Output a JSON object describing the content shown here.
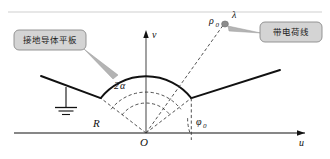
{
  "figure": {
    "callouts": [
      {
        "id": "left-callout",
        "text": "接地导体平板"
      },
      {
        "id": "right-callout",
        "text": "带电荷线"
      }
    ],
    "axes": {
      "horizontal_label": "u",
      "vertical_label": "v",
      "origin_label": "O"
    },
    "labels": {
      "radius": "R",
      "half_angle": "2",
      "half_angle_symbol": "α",
      "phi": "φ",
      "phi_sub": "0",
      "rho": "ρ",
      "rho_sub": "0",
      "lambda": "λ"
    },
    "colors": {
      "stroke": "#111111",
      "dashed": "#3a3a3a",
      "callout_fill": "#d4d4d4",
      "callout_border": "#8a8a8a",
      "callout_text": "#1a1a1a",
      "leader": "#a8a8a8",
      "background": "#ffffff"
    },
    "geometry": {
      "origin_x": 146,
      "origin_y": 133,
      "circle_radius": 58,
      "inner_arc_radius_1": 30,
      "inner_arc_radius_2": 44,
      "phi0_degrees": 37,
      "wedge_half_angle_degrees": 37,
      "charge_point_x": 222,
      "charge_point_y": 26
    }
  }
}
